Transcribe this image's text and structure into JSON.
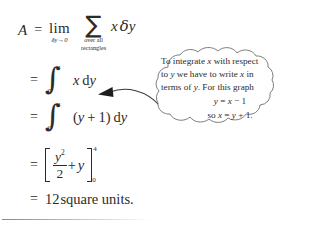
{
  "document": {
    "kind": "math-worked-example",
    "background_color": "#ffffff",
    "text_color": "#2b2b2b"
  },
  "derivation": {
    "line1": {
      "lhs": "A",
      "equals": "=",
      "limit_operator": "lim",
      "limit_subscript": "δy→0",
      "sum_symbol": "∑",
      "sum_subscript_line1": "over all",
      "sum_subscript_line2": "rectangles",
      "operand_x": "x",
      "operand_delta": "δ",
      "operand_y": "y"
    },
    "line2": {
      "equals": "=",
      "integral_symbol": "∫",
      "upper_limit": "4",
      "lower_limit": "0",
      "integrand": "x",
      "differential_d": "d",
      "differential_var": "y"
    },
    "line3": {
      "equals": "=",
      "integral_symbol": "∫",
      "upper_limit": "4",
      "lower_limit": "0",
      "integrand_open": "(",
      "integrand_var": "y",
      "integrand_plus": "+",
      "integrand_const": "1",
      "integrand_close": ")",
      "differential_d": "d",
      "differential_var": "y"
    },
    "line4": {
      "equals": "=",
      "bracket_open": "[",
      "bracket_close": "]",
      "numerator_var": "y",
      "numerator_exp": "2",
      "denominator": "2",
      "plus": "+",
      "second_term": "y",
      "upper_limit": "4",
      "lower_limit": "0"
    },
    "line5": {
      "equals": "=",
      "value": "12",
      "units": "square units."
    }
  },
  "callout": {
    "shape": "cloud-bubble",
    "body": "To integrate x with respect to y we have to write x in terms of y. For this graph",
    "equation_1": "y = x − 1",
    "equation_2": "so x = y + 1.",
    "body_parts": {
      "t1": "To integrate ",
      "v1": "x",
      "t2": " with respect",
      "t3": "to ",
      "v2": "y",
      "t4": " we have to write ",
      "v3": "x",
      "t5": " in",
      "t6": "terms of ",
      "v4": "y",
      "t7": ". For this graph"
    },
    "eq1_parts": {
      "a": "y",
      "b": " = ",
      "c": "x",
      "d": " − 1"
    },
    "eq2_parts": {
      "a": "so ",
      "b": "x",
      "c": " = ",
      "d": "y",
      "e": " + 1."
    }
  },
  "annotations": {
    "arrow": "curved-arrow-pointing-left",
    "bottom_rule": "horizontal-divider"
  }
}
